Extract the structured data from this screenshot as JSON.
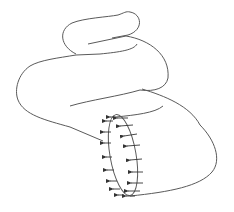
{
  "figure": {
    "stroke_color": "#555555",
    "arrow_color": "#333333",
    "background": "#ffffff",
    "arrow_count_profile": 9,
    "arrow_count_wall": 9
  }
}
